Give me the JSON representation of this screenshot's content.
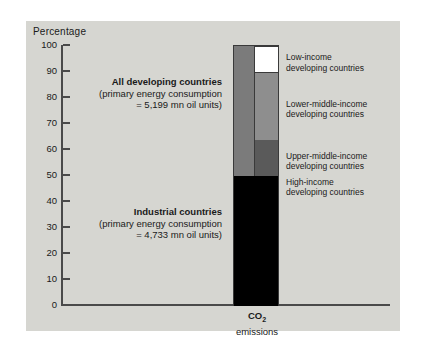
{
  "figure": {
    "axis_label": "Percentage",
    "category_label_line1": "CO",
    "category_label_sub": "2",
    "category_label_line2": "emissions"
  },
  "yaxis": {
    "ticks": [
      "100",
      "90",
      "80",
      "70",
      "60",
      "50",
      "40",
      "30",
      "20",
      "10",
      "0"
    ],
    "min": 0,
    "max": 100,
    "step": 10
  },
  "annotations": [
    {
      "heading": "All developing countries",
      "line2": "(primary energy consumption",
      "line3": "= 5,199 mn oil units)"
    },
    {
      "heading": "Industrial countries",
      "line2": "(primary energy consumption",
      "line3": "= 4,733 mn oil units)"
    }
  ],
  "legend": [
    {
      "line1": "Low-income",
      "line2": "developing countries",
      "color": "#ffffff"
    },
    {
      "line1": "Lower-middle-income",
      "line2": "developing countries",
      "color": "#8e8e8e"
    },
    {
      "line1": "Upper-middle-income",
      "line2": "developing countries",
      "color": "#6f6f6f"
    },
    {
      "line1": "High-income",
      "line2": "developing countries",
      "color": "#5a5a5a"
    }
  ],
  "chart_data": {
    "type": "bar",
    "title": "",
    "subtitle": "",
    "xlabel": "CO2 emissions",
    "ylabel": "Percentage",
    "ylim": [
      0,
      100
    ],
    "grid": false,
    "legend_position": "right",
    "categories": [
      "CO2 emissions"
    ],
    "stacked": true,
    "series": [
      {
        "name": "Industrial countries",
        "values": [
          50
        ],
        "range": [
          0,
          50
        ],
        "color": "#000000"
      },
      {
        "name": "High-income developing countries",
        "values": [
          14
        ],
        "range": [
          50,
          64
        ],
        "color": "#5a5a5a"
      },
      {
        "name": "Upper-middle-income developing countries",
        "values": [
          26
        ],
        "range": [
          64,
          90
        ],
        "color": "#8e8e8e"
      },
      {
        "name": "Low-income developing countries",
        "values": [
          10
        ],
        "range": [
          90,
          100
        ],
        "color": "#ffffff"
      }
    ],
    "annotations": [
      {
        "text": "All developing countries (primary energy consumption = 5,199 mn oil units)",
        "value": 5199,
        "unit": "mn oil units"
      },
      {
        "text": "Industrial countries (primary energy consumption = 4,733 mn oil units)",
        "value": 4733,
        "unit": "mn oil units"
      }
    ]
  },
  "colors": {
    "plate": "#d6d6d1",
    "axis": "#4a4a4a",
    "text": "#1a1a1a",
    "bar_left_block": "#7b7b7b",
    "industrial": "#000000"
  }
}
